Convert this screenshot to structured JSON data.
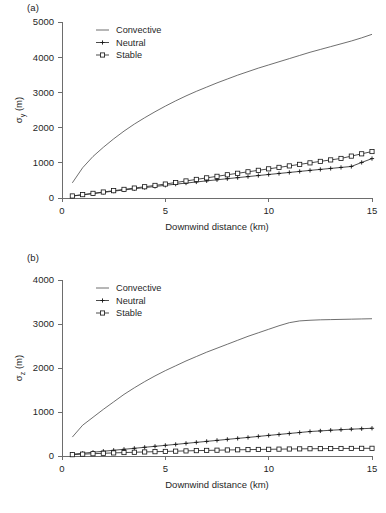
{
  "figure": {
    "panels": [
      {
        "key": "a",
        "label": "(a)",
        "ylabel": "σ",
        "ylabel_sub": "y",
        "ylabel_unit": " (m)",
        "xlabel": "Downwind distance (km)",
        "yticks": [
          "0",
          "1000",
          "2000",
          "3000",
          "4000",
          "5000"
        ],
        "xticks": [
          "0",
          "5",
          "10",
          "15"
        ]
      },
      {
        "key": "b",
        "label": "(b)",
        "ylabel": "σ",
        "ylabel_sub": "z",
        "ylabel_unit": " (m)",
        "xlabel": "Downwind distance (km)",
        "yticks": [
          "0",
          "1000",
          "2000",
          "3000",
          "4000"
        ],
        "xticks": [
          "0",
          "5",
          "10",
          "15"
        ]
      }
    ],
    "legend": {
      "items": [
        {
          "label": "Convective",
          "marker": "line"
        },
        {
          "label": "Neutral",
          "marker": "plus"
        },
        {
          "label": "Stable",
          "marker": "square"
        }
      ]
    },
    "colors": {
      "convective": "#4a4a4a",
      "neutral": "#141414",
      "stable": "#141414",
      "axis": "#6d6d6d",
      "text": "#1f1f1f",
      "background": "#ffffff"
    }
  },
  "chart_data": [
    {
      "type": "line",
      "panel": "a",
      "title": "",
      "xlabel": "Downwind distance (km)",
      "ylabel": "σy (m)",
      "xlim": [
        0,
        15
      ],
      "ylim": [
        0,
        5000
      ],
      "xticks": [
        0,
        5,
        10,
        15
      ],
      "yticks": [
        0,
        1000,
        2000,
        3000,
        4000,
        5000
      ],
      "grid": false,
      "legend_position": "upper-left-inside",
      "x": [
        0.5,
        1.0,
        1.5,
        2.0,
        2.5,
        3.0,
        3.5,
        4.0,
        4.5,
        5.0,
        5.5,
        6.0,
        6.5,
        7.0,
        7.5,
        8.0,
        8.5,
        9.0,
        9.5,
        10.0,
        10.5,
        11.0,
        11.5,
        12.0,
        12.5,
        13.0,
        13.5,
        14.0,
        14.5,
        15.0
      ],
      "series": [
        {
          "name": "Convective",
          "marker": "none",
          "values": [
            430,
            860,
            1180,
            1440,
            1680,
            1900,
            2100,
            2280,
            2450,
            2610,
            2760,
            2900,
            3030,
            3150,
            3270,
            3380,
            3490,
            3590,
            3690,
            3780,
            3870,
            3960,
            4050,
            4140,
            4220,
            4300,
            4380,
            4460,
            4550,
            4650
          ]
        },
        {
          "name": "Neutral",
          "marker": "plus",
          "values": [
            55,
            90,
            125,
            160,
            195,
            228,
            262,
            295,
            328,
            360,
            392,
            424,
            455,
            487,
            518,
            548,
            578,
            608,
            638,
            668,
            697,
            726,
            755,
            784,
            812,
            840,
            868,
            896,
            1010,
            1120
          ]
        },
        {
          "name": "Stable",
          "marker": "square",
          "values": [
            58,
            95,
            132,
            170,
            208,
            245,
            282,
            320,
            358,
            396,
            440,
            484,
            528,
            572,
            616,
            660,
            702,
            744,
            786,
            828,
            870,
            912,
            955,
            998,
            1040,
            1082,
            1124,
            1190,
            1255,
            1320
          ]
        }
      ]
    },
    {
      "type": "line",
      "panel": "b",
      "title": "",
      "xlabel": "Downwind distance (km)",
      "ylabel": "σz (m)",
      "xlim": [
        0,
        15
      ],
      "ylim": [
        0,
        4000
      ],
      "xticks": [
        0,
        5,
        10,
        15
      ],
      "yticks": [
        0,
        1000,
        2000,
        3000,
        4000
      ],
      "grid": false,
      "legend_position": "upper-left-inside",
      "x": [
        0.5,
        1.0,
        1.5,
        2.0,
        2.5,
        3.0,
        3.5,
        4.0,
        4.5,
        5.0,
        5.5,
        6.0,
        6.5,
        7.0,
        7.5,
        8.0,
        8.5,
        9.0,
        9.5,
        10.0,
        10.5,
        11.0,
        11.5,
        12.0,
        12.5,
        13.0,
        13.5,
        14.0,
        14.5,
        15.0
      ],
      "series": [
        {
          "name": "Convective",
          "marker": "none",
          "values": [
            430,
            700,
            880,
            1060,
            1230,
            1400,
            1550,
            1690,
            1820,
            1940,
            2050,
            2160,
            2260,
            2360,
            2450,
            2540,
            2630,
            2720,
            2800,
            2880,
            2960,
            3030,
            3070,
            3085,
            3095,
            3100,
            3105,
            3110,
            3115,
            3120
          ]
        },
        {
          "name": "Neutral",
          "marker": "plus",
          "values": [
            40,
            62,
            85,
            108,
            130,
            152,
            175,
            198,
            220,
            242,
            264,
            287,
            310,
            332,
            355,
            378,
            400,
            422,
            445,
            468,
            490,
            512,
            534,
            556,
            570,
            585,
            598,
            610,
            620,
            630
          ]
        },
        {
          "name": "Stable",
          "marker": "square",
          "values": [
            30,
            42,
            52,
            62,
            70,
            78,
            85,
            92,
            98,
            104,
            110,
            116,
            122,
            127,
            132,
            137,
            141,
            145,
            149,
            152,
            156,
            159,
            162,
            165,
            167,
            169,
            171,
            172,
            174,
            175
          ]
        }
      ]
    }
  ]
}
